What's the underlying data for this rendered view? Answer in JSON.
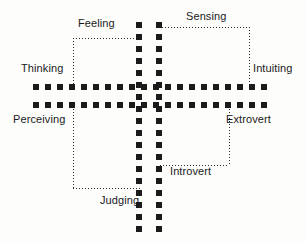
{
  "diagram": {
    "background_color": "#fdfdfc",
    "axis_color": "#1b1b1b",
    "connector_color": "#2b2b2b",
    "text_color": "#1a1a1a",
    "labels": {
      "feeling": "Feeling",
      "sensing": "Sensing",
      "thinking": "Thinking",
      "intuiting": "Intuiting",
      "perceiving": "Perceiving",
      "extrovert": "Extrovert",
      "introvert": "Introvert",
      "judging": "Judging"
    },
    "axes": [
      {
        "name": "vertical-left-axis",
        "orientation": "vertical",
        "position_px": 139
      },
      {
        "name": "vertical-right-axis",
        "orientation": "vertical",
        "position_px": 159
      },
      {
        "name": "horizontal-upper-axis",
        "orientation": "horizontal",
        "position_px": 84
      },
      {
        "name": "horizontal-lower-axis",
        "orientation": "horizontal",
        "position_px": 102
      }
    ],
    "quadrant_brackets": [
      {
        "name": "feeling-thinking-bracket",
        "labels": [
          "Feeling",
          "Thinking"
        ]
      },
      {
        "name": "sensing-intuiting-bracket",
        "labels": [
          "Sensing",
          "Intuiting"
        ]
      },
      {
        "name": "extrovert-introvert-bracket",
        "labels": [
          "Extrovert",
          "Introvert"
        ]
      },
      {
        "name": "perceiving-judging-bracket",
        "labels": [
          "Perceiving",
          "Judging"
        ]
      }
    ]
  }
}
